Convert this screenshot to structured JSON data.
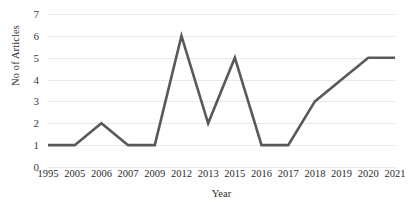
{
  "chart_data": {
    "type": "line",
    "title": "",
    "xlabel": "Year",
    "ylabel": "No of Articles",
    "categories": [
      "1995",
      "2005",
      "2006",
      "2007",
      "2009",
      "2012",
      "2013",
      "2015",
      "2016",
      "2017",
      "2018",
      "2019",
      "2020",
      "2021"
    ],
    "values": [
      1,
      1,
      2,
      1,
      1,
      6,
      2,
      5,
      1,
      1,
      3,
      4,
      5,
      5
    ],
    "series": [
      {
        "name": "No of Articles",
        "values": [
          1,
          1,
          2,
          1,
          1,
          6,
          2,
          5,
          1,
          1,
          3,
          4,
          5,
          5
        ]
      }
    ],
    "ylim": [
      0,
      7
    ],
    "y_ticks": [
      "0",
      "1",
      "2",
      "3",
      "4",
      "5",
      "6",
      "7"
    ],
    "grid": true,
    "legend": false,
    "legend_position": "none",
    "line_color": "#595959",
    "gridline_color": "#e8e8e8",
    "text_color": "#2b2b2b",
    "background_color": "#ffffff"
  }
}
